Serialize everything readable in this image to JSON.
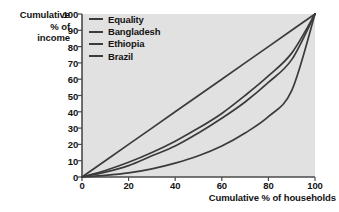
{
  "chart_data": {
    "type": "line",
    "title": "",
    "xlabel": "Cumulative % of households",
    "ylabel": "Cumulative\n% of\nincome",
    "ylabel_lines": [
      "Cumulative",
      "% of",
      "income"
    ],
    "xlim": [
      0,
      100
    ],
    "ylim": [
      0,
      100
    ],
    "xticks": [
      0,
      20,
      40,
      60,
      80,
      100
    ],
    "yticks": [
      0,
      10,
      20,
      30,
      40,
      50,
      60,
      70,
      80,
      90,
      100
    ],
    "grid": false,
    "legend_position": "top-left-inside",
    "plot_background": "#e1e1e1",
    "line_color": "#3b3b3b",
    "series": [
      {
        "name": "Equality",
        "color": "#3b3b3b",
        "x": [
          0,
          10,
          20,
          30,
          40,
          50,
          60,
          70,
          80,
          90,
          100
        ],
        "values": [
          0,
          10,
          20,
          30,
          40,
          50,
          60,
          70,
          80,
          90,
          100
        ]
      },
      {
        "name": "Bangladesh",
        "color": "#3b3b3b",
        "x": [
          0,
          10,
          20,
          30,
          40,
          50,
          60,
          70,
          80,
          90,
          100
        ],
        "values": [
          0,
          4,
          9,
          15,
          22,
          30,
          39,
          50,
          62,
          76,
          100
        ]
      },
      {
        "name": "Ethiopia",
        "color": "#3b3b3b",
        "x": [
          0,
          10,
          20,
          30,
          40,
          50,
          60,
          70,
          80,
          90,
          100
        ],
        "values": [
          0,
          3,
          7,
          13,
          19,
          27,
          36,
          46,
          58,
          72,
          100
        ]
      },
      {
        "name": "Brazil",
        "color": "#3b3b3b",
        "x": [
          0,
          10,
          20,
          30,
          40,
          50,
          60,
          70,
          80,
          90,
          100
        ],
        "values": [
          0,
          1,
          2.5,
          5,
          8.5,
          13,
          19,
          27,
          37,
          53,
          100
        ]
      }
    ]
  },
  "legend": {
    "items": [
      {
        "label": "Equality"
      },
      {
        "label": "Bangladesh"
      },
      {
        "label": "Ethiopia"
      },
      {
        "label": "Brazil"
      }
    ]
  },
  "axes": {
    "y_title_line1": "Cumulative",
    "y_title_line2": "% of",
    "y_title_line3": "income",
    "x_title": "Cumulative % of households",
    "y_tick_0": "0",
    "y_tick_10": "10",
    "y_tick_20": "20",
    "y_tick_30": "30",
    "y_tick_40": "40",
    "y_tick_50": "50",
    "y_tick_60": "60",
    "y_tick_70": "70",
    "y_tick_80": "80",
    "y_tick_90": "90",
    "y_tick_100": "100",
    "x_tick_0": "0",
    "x_tick_20": "20",
    "x_tick_40": "40",
    "x_tick_60": "60",
    "x_tick_80": "80",
    "x_tick_100": "100"
  }
}
